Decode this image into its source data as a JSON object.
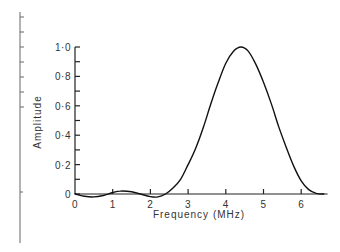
{
  "chart_data": {
    "type": "line",
    "title": "",
    "xlabel": "Frequency (MHz)",
    "ylabel": "Amplitude",
    "xlim": [
      0,
      6.7
    ],
    "ylim": [
      0,
      1.0
    ],
    "grid": false,
    "legend": null,
    "x_ticks": [
      0,
      1,
      2,
      3,
      4,
      5,
      6
    ],
    "x_tick_labels": [
      "0",
      "1",
      "2",
      "3",
      "4",
      "5",
      "6"
    ],
    "y_ticks": [
      0,
      0.1,
      0.2,
      0.3,
      0.4,
      0.5,
      0.6,
      0.7,
      0.8,
      0.9,
      1.0
    ],
    "y_tick_labels": [
      {
        "value": 0,
        "label": "0"
      },
      {
        "value": 0.2,
        "label": "0·2"
      },
      {
        "value": 0.4,
        "label": "0·4"
      },
      {
        "value": 0.6,
        "label": "0·6"
      },
      {
        "value": 0.8,
        "label": "0·8"
      },
      {
        "value": 1.0,
        "label": "1·0"
      }
    ],
    "series": [
      {
        "name": "Amplitude spectrum",
        "x": [
          0,
          0.25,
          0.5,
          0.75,
          1.0,
          1.2,
          1.5,
          1.8,
          2.0,
          2.2,
          2.4,
          2.6,
          2.8,
          3.0,
          3.2,
          3.4,
          3.6,
          3.8,
          4.0,
          4.2,
          4.4,
          4.6,
          4.8,
          5.0,
          5.2,
          5.4,
          5.6,
          5.8,
          6.0,
          6.2,
          6.4,
          6.6
        ],
        "y": [
          0,
          -0.015,
          -0.02,
          -0.01,
          0.01,
          0.02,
          0.015,
          -0.005,
          -0.018,
          -0.02,
          0.0,
          0.04,
          0.1,
          0.2,
          0.31,
          0.45,
          0.61,
          0.76,
          0.89,
          0.97,
          1.0,
          0.97,
          0.88,
          0.76,
          0.62,
          0.46,
          0.32,
          0.19,
          0.09,
          0.03,
          0.005,
          0.0
        ]
      }
    ]
  },
  "frame": {
    "left_rule_ticks": 8
  }
}
